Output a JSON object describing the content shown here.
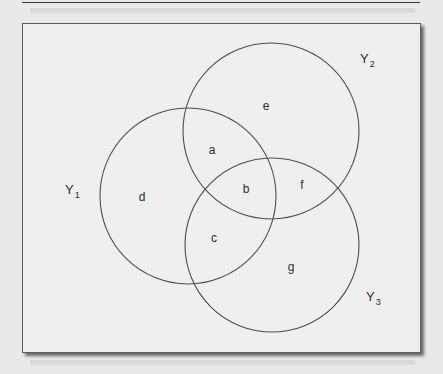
{
  "figure": {
    "type": "venn-diagram",
    "sets": [
      {
        "name": "Y1",
        "label_main": "Y",
        "label_sub": "1",
        "cx": 188,
        "cy": 196,
        "r": 88,
        "label_x": 65,
        "label_y": 194
      },
      {
        "name": "Y2",
        "label_main": "Y",
        "label_sub": "2",
        "cx": 271,
        "cy": 131,
        "r": 88,
        "label_x": 360,
        "label_y": 63
      },
      {
        "name": "Y3",
        "label_main": "Y",
        "label_sub": "3",
        "cx": 272,
        "cy": 245,
        "r": 87,
        "label_x": 366,
        "label_y": 301
      }
    ],
    "regions": [
      {
        "id": "a",
        "label": "a",
        "x": 212,
        "y": 154
      },
      {
        "id": "b",
        "label": "b",
        "x": 246,
        "y": 193
      },
      {
        "id": "c",
        "label": "c",
        "x": 214,
        "y": 242
      },
      {
        "id": "d",
        "label": "d",
        "x": 142,
        "y": 201
      },
      {
        "id": "e",
        "label": "e",
        "x": 266,
        "y": 110
      },
      {
        "id": "f",
        "label": "f",
        "x": 302,
        "y": 189
      },
      {
        "id": "g",
        "label": "g",
        "x": 291,
        "y": 271
      }
    ],
    "colors": {
      "stroke": "#4d4d4d",
      "label": "#2c2c2c",
      "panel": "#efefef",
      "page": "#e9e9e9"
    }
  }
}
